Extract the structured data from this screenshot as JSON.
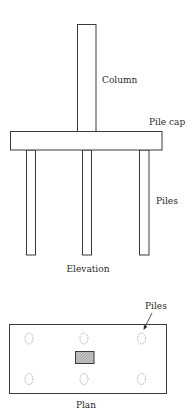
{
  "diagram": {
    "elevation": {
      "title": "Elevation",
      "labels": {
        "column": "Column",
        "pile_cap": "Pile cap",
        "piles": "Piles"
      },
      "pile_count": 3
    },
    "plan": {
      "title": "Plan",
      "labels": {
        "piles": "Piles"
      },
      "pile_grid": {
        "rows": 2,
        "cols": 3
      },
      "column_fill": "hatched"
    },
    "colors": {
      "line": "#3a3a3a",
      "pile_outline": "#8a8a8a",
      "background": "#ffffff"
    }
  }
}
